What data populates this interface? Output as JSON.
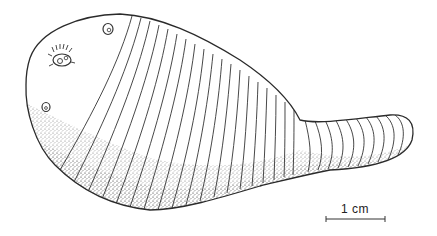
{
  "figure": {
    "style": "stippled line drawing",
    "line_color": "#333333",
    "stipple_color": "#555555",
    "background": "#ffffff"
  },
  "scale_bar": {
    "label": "1 cm"
  }
}
